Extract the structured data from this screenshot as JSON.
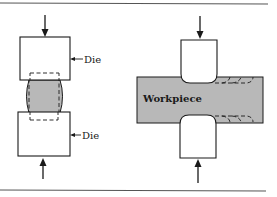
{
  "figure": {
    "type": "forging-diagram",
    "colors": {
      "line": "#1a1a1a",
      "workpiece_fill": "#b8b8b8",
      "die_fill": "#ffffff",
      "rule": "#555555"
    },
    "left_panel": {
      "description": "Open-die upsetting between flat dies",
      "top_die_label": "Die",
      "bottom_die_label": "Die"
    },
    "right_panel": {
      "description": "Drawing out / fullering a workpiece between dies",
      "workpiece_label": "Workpiece"
    }
  }
}
